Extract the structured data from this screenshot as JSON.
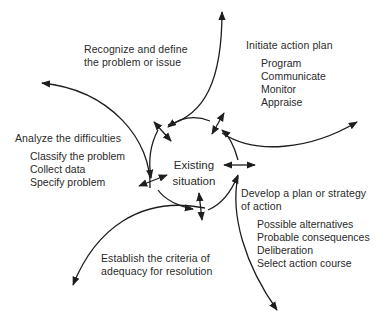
{
  "center": {
    "line1": "Existing",
    "line2": "situation"
  },
  "stages": {
    "recognize": {
      "title_line1": "Recognize and define",
      "title_line2": "the problem or issue"
    },
    "initiate": {
      "title": "Initiate action plan",
      "items": [
        "Program",
        "Communicate",
        "Monitor",
        "Appraise"
      ]
    },
    "analyze": {
      "title": "Analyze the difficulties",
      "items": [
        "Classify the problem",
        "Collect data",
        "Specify problem"
      ]
    },
    "develop": {
      "title_line1": "Develop a plan or strategy",
      "title_line2": "of action",
      "items": [
        "Possible alternatives",
        "Probable consequences",
        "Deliberation",
        "Select action course"
      ]
    },
    "establish": {
      "title_line1": "Establish the criteria of",
      "title_line2": "adequacy for resolution"
    }
  },
  "colors": {
    "stroke": "#1e1e1e",
    "text": "#2a2a2a",
    "background": "#ffffff"
  }
}
